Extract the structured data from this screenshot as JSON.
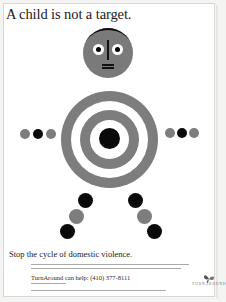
{
  "poster": {
    "headline": "A child is not a target.",
    "tagline": "Stop the cycle of domestic violence.",
    "call_to_action": "TurnAround can help: (410) 377-8111",
    "logo": {
      "name": "TURNAROUND",
      "icon": "butterfly-icon"
    },
    "colors": {
      "gray": "#7d7d7d",
      "black": "#0a0a0a",
      "background": "#ffffff"
    },
    "figure": {
      "head": "gray circle face with black hair arc, two eyes, nose line, mouth",
      "body": "gray bullseye target with black center",
      "arms": [
        "gray",
        "black",
        "gray"
      ],
      "legs": [
        "black",
        "gray",
        "black"
      ]
    }
  }
}
